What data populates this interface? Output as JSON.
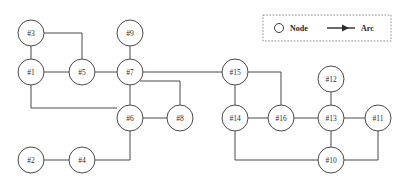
{
  "diagram": {
    "background_color": "#ffffff",
    "line_color": "#4a4a4a",
    "node_fill": "#ffffff",
    "node_radius": 13
  },
  "legend": {
    "node_label": "Node",
    "arc_label": "Arc",
    "node_icon": "circle-icon",
    "arc_icon": "arrow-right-icon",
    "border_style": "dotted",
    "box": {
      "x": 263,
      "y": 15,
      "width": 128,
      "height": 26
    }
  },
  "nodes": [
    {
      "id": "n3",
      "label": "#3",
      "x": 31,
      "y": 33
    },
    {
      "id": "n9",
      "label": "#9",
      "x": 130,
      "y": 33
    },
    {
      "id": "n1",
      "label": "#1",
      "x": 31,
      "y": 72
    },
    {
      "id": "n5",
      "label": "#5",
      "x": 82,
      "y": 72
    },
    {
      "id": "n7",
      "label": "#7",
      "x": 130,
      "y": 72
    },
    {
      "id": "n15",
      "label": "#15",
      "x": 235,
      "y": 72
    },
    {
      "id": "n12",
      "label": "#12",
      "x": 331,
      "y": 79
    },
    {
      "id": "n6",
      "label": "#6",
      "x": 130,
      "y": 118
    },
    {
      "id": "n8",
      "label": "#8",
      "x": 180,
      "y": 118
    },
    {
      "id": "n14",
      "label": "#14",
      "x": 235,
      "y": 118
    },
    {
      "id": "n16",
      "label": "#16",
      "x": 281,
      "y": 118
    },
    {
      "id": "n13",
      "label": "#13",
      "x": 331,
      "y": 118
    },
    {
      "id": "n11",
      "label": "#11",
      "x": 378,
      "y": 118
    },
    {
      "id": "n2",
      "label": "#2",
      "x": 31,
      "y": 160
    },
    {
      "id": "n4",
      "label": "#4",
      "x": 82,
      "y": 160
    },
    {
      "id": "n10",
      "label": "#10",
      "x": 331,
      "y": 160
    }
  ],
  "edges": [
    {
      "from": "n3",
      "to": "n1",
      "path": "M 31 46 L 31 59"
    },
    {
      "from": "n3",
      "to": "n5",
      "path": "M 44 33 L 82 33 L 82 59"
    },
    {
      "from": "n1",
      "to": "n5",
      "path": "M 44 72 L 69 72"
    },
    {
      "from": "n5",
      "to": "n7",
      "path": "M 95 72 L 117 72"
    },
    {
      "from": "n9",
      "to": "n7",
      "path": "M 130 46 L 130 59"
    },
    {
      "from": "n7",
      "to": "n15",
      "path": "M 143 72 L 222 72"
    },
    {
      "from": "n7",
      "to": "n6",
      "path": "M 130 85 L 130 105"
    },
    {
      "from": "n7",
      "to": "n8",
      "path": "M 140 81 L 180 81 L 180 105"
    },
    {
      "from": "n1",
      "to": "n6",
      "path": "M 31 85 L 31 108 L 117 108"
    },
    {
      "from": "n6",
      "to": "n8",
      "path": "M 143 118 L 167 118"
    },
    {
      "from": "n6",
      "to": "n4",
      "path": "M 130 131 L 130 160 L 95 160"
    },
    {
      "from": "n2",
      "to": "n4",
      "path": "M 44 160 L 69 160"
    },
    {
      "from": "n15",
      "to": "n14",
      "path": "M 235 85 L 235 105"
    },
    {
      "from": "n15",
      "to": "n16",
      "path": "M 248 72 L 281 72 L 281 105"
    },
    {
      "from": "n14",
      "to": "n16",
      "path": "M 248 118 L 268 118"
    },
    {
      "from": "n16",
      "to": "n13",
      "path": "M 294 118 L 318 118"
    },
    {
      "from": "n12",
      "to": "n13",
      "path": "M 331 92 L 331 105"
    },
    {
      "from": "n13",
      "to": "n11",
      "path": "M 344 118 L 365 118"
    },
    {
      "from": "n13",
      "to": "n10",
      "path": "M 331 131 L 331 147"
    },
    {
      "from": "n11",
      "to": "n10",
      "path": "M 378 131 L 378 160 L 344 160"
    },
    {
      "from": "n14",
      "to": "n10",
      "path": "M 235 131 L 235 160 L 318 160"
    }
  ]
}
